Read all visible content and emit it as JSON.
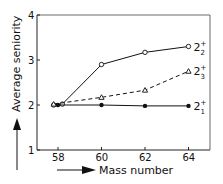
{
  "chart_data": {
    "type": "line",
    "title": "",
    "xlabel": "Mass number",
    "ylabel": "Average seniority",
    "xlim": [
      57,
      65
    ],
    "ylim": [
      1,
      4
    ],
    "x_ticks": [
      "58",
      "60",
      "62",
      "64"
    ],
    "y_ticks": [
      "1",
      "2",
      "3",
      "4"
    ],
    "grid": false,
    "legend_position": "inline-right",
    "series": [
      {
        "name": "2_2^+",
        "label_main": "2",
        "label_sup": "+",
        "label_sub": "2",
        "style": "solid",
        "marker": "open-circle",
        "x": [
          57.8,
          58.2,
          60,
          62,
          64
        ],
        "values": [
          2.0,
          2.02,
          2.9,
          3.17,
          3.3
        ]
      },
      {
        "name": "2_3^+",
        "label_main": "2",
        "label_sup": "+",
        "label_sub": "3",
        "style": "dashed",
        "marker": "open-triangle",
        "x": [
          57.8,
          60,
          62,
          64
        ],
        "values": [
          2.02,
          2.17,
          2.33,
          2.75
        ]
      },
      {
        "name": "2_1^+",
        "label_main": "2",
        "label_sup": "+",
        "label_sub": "1",
        "style": "solid",
        "marker": "filled-circle",
        "x": [
          58,
          60,
          62,
          64
        ],
        "values": [
          2.0,
          2.0,
          1.98,
          1.98
        ]
      }
    ]
  }
}
